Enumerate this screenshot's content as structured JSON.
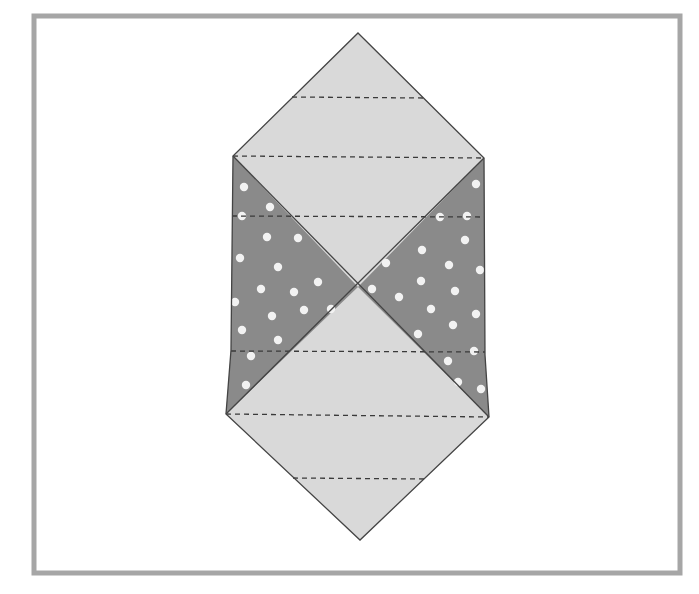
{
  "figure": {
    "colors": {
      "frame": "#a6a6a6",
      "background": "#ffffff",
      "light_fill": "#d9d9d9",
      "dark_fill": "#8a8a8a",
      "outline": "#444444",
      "dash": "#3a3a3a",
      "dot": "#f2f2f2"
    },
    "frame": {
      "x": 34,
      "y": 16,
      "width": 646,
      "height": 557,
      "stroke_width": 5
    },
    "vertices": {
      "top_apex": [
        358,
        33
      ],
      "upper_left": [
        233,
        156
      ],
      "upper_right": [
        484,
        158
      ],
      "mid_left": [
        231,
        350
      ],
      "mid_right": [
        485,
        355
      ],
      "lower_left": [
        226,
        414
      ],
      "lower_right": [
        489,
        417
      ],
      "bottom_apex": [
        360,
        540
      ],
      "center": [
        358,
        287
      ]
    },
    "dashed_lines": [
      {
        "x1": 292,
        "y1": 97,
        "x2": 424,
        "y2": 98
      },
      {
        "x1": 233,
        "y1": 156,
        "x2": 484,
        "y2": 158
      },
      {
        "x1": 232,
        "y1": 216,
        "x2": 484,
        "y2": 217
      },
      {
        "x1": 231,
        "y1": 351,
        "x2": 485,
        "y2": 352
      },
      {
        "x1": 226,
        "y1": 414,
        "x2": 489,
        "y2": 417
      },
      {
        "x1": 293,
        "y1": 478,
        "x2": 425,
        "y2": 479
      }
    ],
    "dots_left": [
      [
        244,
        187
      ],
      [
        270,
        207
      ],
      [
        242,
        216
      ],
      [
        267,
        237
      ],
      [
        298,
        238
      ],
      [
        240,
        258
      ],
      [
        278,
        267
      ],
      [
        318,
        282
      ],
      [
        261,
        289
      ],
      [
        294,
        292
      ],
      [
        235,
        302
      ],
      [
        272,
        316
      ],
      [
        304,
        310
      ],
      [
        331,
        309
      ],
      [
        242,
        330
      ],
      [
        278,
        340
      ],
      [
        251,
        356
      ],
      [
        246,
        385
      ]
    ],
    "dots_right": [
      [
        476,
        184
      ],
      [
        440,
        217
      ],
      [
        467,
        216
      ],
      [
        465,
        240
      ],
      [
        422,
        250
      ],
      [
        449,
        265
      ],
      [
        480,
        270
      ],
      [
        386,
        263
      ],
      [
        421,
        281
      ],
      [
        372,
        289
      ],
      [
        399,
        297
      ],
      [
        455,
        291
      ],
      [
        431,
        309
      ],
      [
        476,
        314
      ],
      [
        453,
        325
      ],
      [
        418,
        334
      ],
      [
        474,
        351
      ],
      [
        448,
        361
      ],
      [
        458,
        382
      ],
      [
        481,
        389
      ]
    ]
  }
}
